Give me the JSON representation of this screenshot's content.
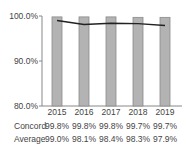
{
  "chart_data": {
    "type": "bar",
    "title": "",
    "xlabel": "",
    "ylabel": "",
    "categories": [
      "2015",
      "2016",
      "2017",
      "2018",
      "2019"
    ],
    "series": [
      {
        "name": "Concord",
        "type": "bar",
        "values": [
          99.8,
          99.8,
          99.8,
          99.7,
          99.7
        ],
        "labels": [
          "99.8%",
          "99.8%",
          "99.8%",
          "99.7%",
          "99.7%"
        ],
        "color": "#b3b3b3"
      },
      {
        "name": "Average",
        "type": "line",
        "values": [
          99.0,
          98.1,
          98.4,
          98.3,
          97.9
        ],
        "labels": [
          "99.0%",
          "98.1%",
          "98.4%",
          "98.3%",
          "97.9%"
        ],
        "color": "#222222"
      }
    ],
    "ylim": [
      80,
      100
    ],
    "yticks": [
      "80.0%",
      "90.0%",
      "100.0%"
    ],
    "grid": false,
    "legend": "data table below chart"
  },
  "table": {
    "row_labels": [
      "Concord",
      "Average"
    ]
  }
}
